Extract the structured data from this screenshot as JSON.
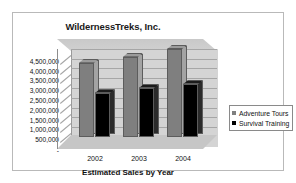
{
  "frame": {
    "border_color": "#b9b9b9"
  },
  "chart_data": {
    "type": "bar",
    "title": "WildernessTreks, Inc.",
    "xlabel": "Estimated Sales by Year",
    "ylabel": "",
    "categories": [
      "2002",
      "2003",
      "2004"
    ],
    "series": [
      {
        "name": "Adventure Tours",
        "color": "#7f7f7f",
        "values": [
          3800000,
          4100000,
          4500000
        ]
      },
      {
        "name": "Survival Training",
        "color": "#000000",
        "values": [
          2250000,
          2500000,
          2700000
        ]
      }
    ],
    "ylim": [
      0,
      4700000
    ],
    "yticks": [
      4500000,
      4000000,
      3500000,
      3000000,
      2500000,
      2000000,
      1500000,
      1000000,
      500000
    ],
    "ytick_labels": [
      "4,500,000",
      "4,000,000",
      "3,500,000",
      "3,000,000",
      "2,500,000",
      "2,000,000",
      "1,500,000",
      "1,000,000",
      "500,000"
    ],
    "zero_tick_label": "-",
    "grid": true,
    "legend_position": "right",
    "style": "3d-clustered-column"
  },
  "legend": {
    "entries": [
      {
        "label": "Adventure Tours",
        "color": "#7f7f7f"
      },
      {
        "label": "Survival Training",
        "color": "#000000"
      }
    ]
  }
}
